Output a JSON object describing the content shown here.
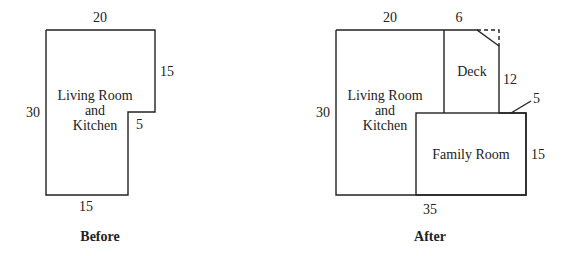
{
  "before": {
    "caption": "Before",
    "room_label": [
      "Living Room",
      "and",
      "Kitchen"
    ],
    "dims": {
      "top": "20",
      "right_upper": "15",
      "left": "30",
      "notch": "5",
      "bottom": "15"
    }
  },
  "after": {
    "caption": "After",
    "living_label": [
      "Living Room",
      "and",
      "Kitchen"
    ],
    "deck_label": "Deck",
    "family_label": "Family Room",
    "dims": {
      "top_left": "20",
      "top_deck": "6",
      "left": "30",
      "deck_right": "12",
      "offset": "5",
      "family_right": "15",
      "bottom": "35"
    }
  }
}
